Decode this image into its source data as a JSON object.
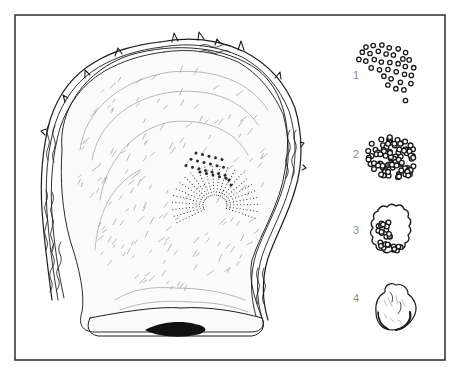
{
  "figure": {
    "colors": {
      "ink": "#1c1c1c",
      "frame": "#3a3a3a",
      "label": "#8c8c8c",
      "background": "#ffffff"
    },
    "stages": [
      {
        "number": "1",
        "description": "scattered nacre nuclei"
      },
      {
        "number": "2",
        "description": "clustered nuclei"
      },
      {
        "number": "3",
        "description": "fused irregular mass"
      },
      {
        "number": "4",
        "description": "formed pearl"
      }
    ]
  }
}
